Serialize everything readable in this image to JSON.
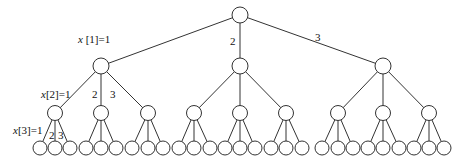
{
  "diagram": {
    "type": "tree",
    "branching_factor": 3,
    "depth": 3,
    "levels": [
      {
        "level": 0,
        "y": 15,
        "r": 8,
        "x": [
          240
        ]
      },
      {
        "level": 1,
        "y": 66,
        "r": 8,
        "x": [
          101,
          240,
          383
        ]
      },
      {
        "level": 2,
        "y": 113,
        "r": 7.5,
        "x": [
          55,
          101,
          148,
          194,
          240,
          286,
          338,
          383,
          429
        ]
      },
      {
        "level": 3,
        "y": 148,
        "r": 7,
        "x": [
          40,
          55,
          70,
          86,
          101,
          116,
          132,
          148,
          163,
          179,
          194,
          210,
          225,
          240,
          255,
          271,
          286,
          302,
          322,
          338,
          353,
          368,
          383,
          399,
          414,
          429,
          444
        ]
      }
    ],
    "labels": [
      {
        "id": "x1-eq-1",
        "text": "x [1]=1",
        "var": "x",
        "rest": " [1]=1",
        "x": 78,
        "y": 43
      },
      {
        "id": "x1-2",
        "text": "2",
        "x": 230,
        "y": 45
      },
      {
        "id": "x1-3",
        "text": "3",
        "x": 315,
        "y": 41
      },
      {
        "id": "x2-eq-1",
        "text": "x [2]=1",
        "var": "x",
        "rest": "[2]=1",
        "x": 41,
        "y": 98
      },
      {
        "id": "x2-2",
        "text": "2",
        "x": 92,
        "y": 98
      },
      {
        "id": "x2-3",
        "text": "3",
        "x": 110,
        "y": 98
      },
      {
        "id": "x3-eq-1",
        "text": "x [3]=1",
        "var": "x",
        "rest": "[3]=1",
        "x": 13,
        "y": 134
      },
      {
        "id": "x3-2",
        "text": "2",
        "x": 49,
        "y": 139
      },
      {
        "id": "x3-3",
        "text": "3",
        "x": 58,
        "y": 139
      }
    ]
  }
}
